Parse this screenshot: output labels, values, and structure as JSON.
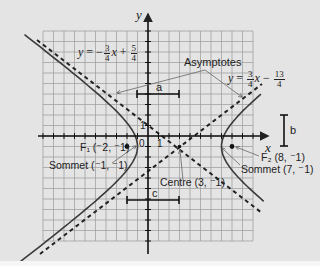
{
  "figure": {
    "type": "hyperbola-diagram",
    "background": "#e4e4e4",
    "grid_color": "#9a9a9a",
    "curve_color": "#3a3a3a",
    "axis_color": "#111111"
  },
  "axes": {
    "x_label": "x",
    "y_label": "y",
    "origin_label": "0",
    "x_tick_label": "1",
    "y_tick_label": "1",
    "x_range": [
      -10,
      10
    ],
    "y_range": [
      -10,
      10
    ]
  },
  "hyperbola": {
    "center": [
      3,
      -1
    ],
    "a": 4,
    "b": 3,
    "c": 5,
    "orientation": "horizontal"
  },
  "labels": {
    "asymptote_left_eq": {
      "y": "y",
      "eq": "=",
      "sign": "−",
      "num1": "3",
      "den1": "4",
      "x": "x",
      "plus": "+",
      "num2": "5",
      "den2": "4"
    },
    "asymptote_right_eq": {
      "y": "y",
      "eq": "=",
      "num1": "3",
      "den1": "4",
      "x": "x",
      "minus": "−",
      "num2": "13",
      "den2": "4"
    },
    "asymptotes": "Asymptotes",
    "a": "a",
    "b": "b",
    "c": "c",
    "focus1": "F₁ (⁻2, ⁻1)",
    "focus2": "F₂ (8, ⁻1)",
    "vertex1": "Sommet (⁻1, ⁻1)",
    "vertex2": "Sommet (7, ⁻1)",
    "centre": "Centre (3, ⁻1)"
  }
}
